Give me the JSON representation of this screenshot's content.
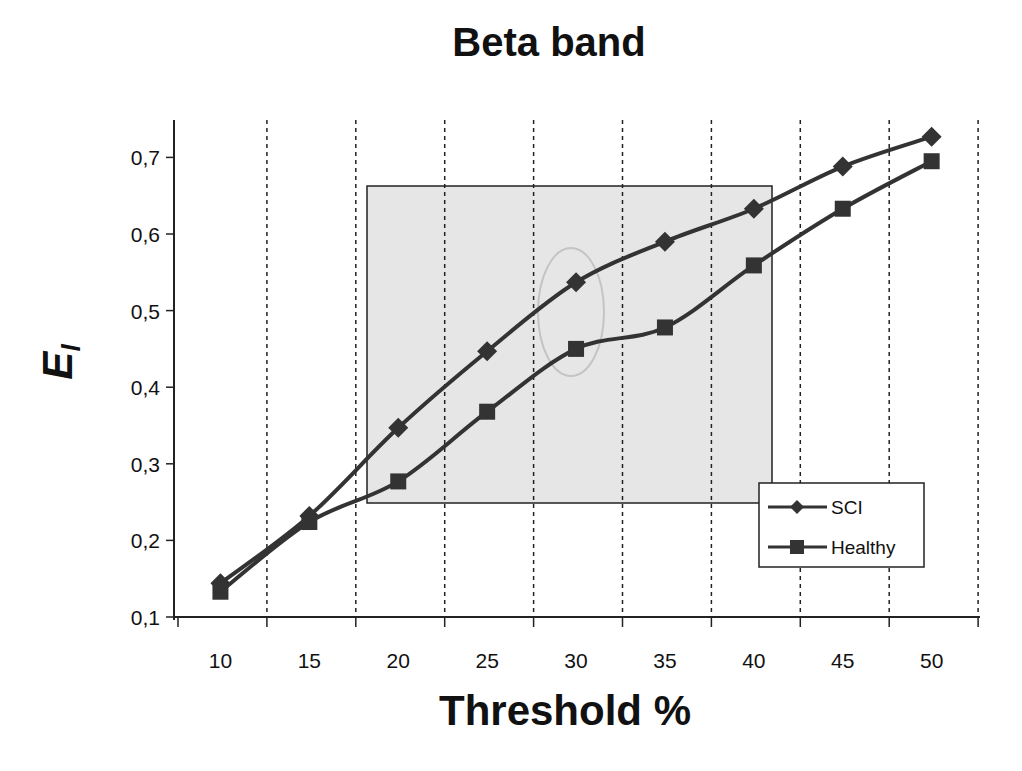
{
  "chart_data": {
    "type": "line",
    "title": "Beta band",
    "xlabel": "Threshold %",
    "ylabel": "E",
    "ylabel_subscript": "l",
    "categories": [
      "10",
      "15",
      "20",
      "25",
      "30",
      "35",
      "40",
      "45",
      "50"
    ],
    "series": [
      {
        "name": "SCI",
        "marker": "diamond",
        "color": "#333333",
        "values": [
          0.144,
          0.232,
          0.347,
          0.447,
          0.537,
          0.59,
          0.633,
          0.688,
          0.727
        ]
      },
      {
        "name": "Healthy",
        "marker": "square",
        "color": "#333333",
        "values": [
          0.133,
          0.224,
          0.277,
          0.368,
          0.45,
          0.478,
          0.559,
          0.633,
          0.695
        ]
      }
    ],
    "ylim": [
      0.1,
      0.75
    ],
    "yticks": [
      "0,1",
      "0,2",
      "0,3",
      "0,4",
      "0,5",
      "0,6",
      "0,7"
    ],
    "ytick_values": [
      0.1,
      0.2,
      0.3,
      0.4,
      0.5,
      0.6,
      0.7
    ],
    "grid": {
      "x": "dashed vertical lines between categories",
      "y": false
    },
    "legend": {
      "position": "lower right inside plot",
      "entries": [
        "SCI",
        "Healthy"
      ]
    },
    "annotations": [
      {
        "type": "shaded-rectangle",
        "x_from": "~18",
        "x_to": "~41",
        "y_from": 0.25,
        "y_to": 0.665,
        "color": "#e6e6e6"
      },
      {
        "type": "ellipse",
        "center_x": "30",
        "center_y": 0.5,
        "color": "#c8c8c8"
      }
    ]
  }
}
